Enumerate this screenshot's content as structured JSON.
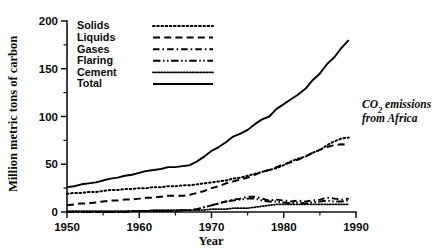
{
  "figure": {
    "annotation_line1": "CO2 emissions",
    "annotation_line1_main": "CO",
    "annotation_line1_sub": "2",
    "annotation_line1_rest": " emissions",
    "annotation_line2": "from Africa"
  },
  "axes": {
    "y_title": "Million metric tons of carbon",
    "x_title": "Year",
    "y_ticks": [
      "0",
      "50",
      "100",
      "150",
      "200"
    ],
    "x_ticks": [
      "1950",
      "1960",
      "1970",
      "1980",
      "1990"
    ]
  },
  "legend": {
    "entries": [
      {
        "label": "Solids",
        "style": "dotted"
      },
      {
        "label": "Liquids",
        "style": "dashed"
      },
      {
        "label": "Gases",
        "style": "dash-dot"
      },
      {
        "label": "Flaring",
        "style": "dash-dot-dot"
      },
      {
        "label": "Cement",
        "style": "fine-dotted"
      },
      {
        "label": "Total",
        "style": "solid"
      }
    ]
  },
  "chart_data": {
    "type": "line",
    "title": "CO2 emissions from Africa",
    "xlabel": "Year",
    "ylabel": "Million metric tons of carbon",
    "xlim": [
      1950,
      1990
    ],
    "ylim": [
      0,
      200
    ],
    "xticks": [
      1950,
      1960,
      1970,
      1980,
      1990
    ],
    "yticks": [
      0,
      50,
      100,
      150,
      200
    ],
    "grid": false,
    "legend_position": "top-left-inside",
    "x": [
      1950,
      1951,
      1952,
      1953,
      1954,
      1955,
      1956,
      1957,
      1958,
      1959,
      1960,
      1961,
      1962,
      1963,
      1964,
      1965,
      1966,
      1967,
      1968,
      1969,
      1970,
      1971,
      1972,
      1973,
      1974,
      1975,
      1976,
      1977,
      1978,
      1979,
      1980,
      1981,
      1982,
      1983,
      1984,
      1985,
      1986,
      1987,
      1988,
      1989
    ],
    "series": [
      {
        "name": "Total",
        "style": "solid",
        "values": [
          26,
          27,
          29,
          30,
          31,
          33,
          35,
          36,
          38,
          39,
          41,
          43,
          44,
          45,
          47,
          47,
          48,
          49,
          53,
          58,
          64,
          68,
          73,
          79,
          82,
          86,
          92,
          97,
          100,
          108,
          113,
          118,
          123,
          129,
          138,
          145,
          155,
          162,
          172,
          180
        ]
      },
      {
        "name": "Solids",
        "style": "dotted",
        "values": [
          19,
          20,
          20,
          21,
          21,
          22,
          23,
          23,
          24,
          24,
          25,
          25,
          26,
          26,
          27,
          27,
          28,
          28,
          29,
          30,
          31,
          32,
          33,
          35,
          36,
          38,
          40,
          42,
          44,
          46,
          49,
          53,
          56,
          58,
          62,
          65,
          70,
          74,
          77,
          78
        ]
      },
      {
        "name": "Liquids",
        "style": "dashed",
        "values": [
          7,
          8,
          9,
          9,
          10,
          11,
          12,
          12,
          13,
          13,
          14,
          15,
          15,
          16,
          17,
          17,
          17,
          18,
          20,
          22,
          25,
          27,
          30,
          32,
          34,
          36,
          39,
          42,
          44,
          47,
          50,
          52,
          55,
          58,
          62,
          65,
          68,
          70,
          71,
          70
        ]
      },
      {
        "name": "Gases",
        "style": "dash-dot",
        "values": [
          0,
          0,
          0,
          0,
          0,
          0,
          0,
          0,
          0,
          1,
          1,
          1,
          1,
          1,
          1,
          1,
          2,
          2,
          3,
          5,
          7,
          9,
          11,
          13,
          14,
          16,
          16,
          14,
          12,
          13,
          12,
          11,
          12,
          11,
          12,
          13,
          15,
          14,
          13,
          14
        ]
      },
      {
        "name": "Flaring",
        "style": "dash-dot-dot",
        "values": [
          0,
          0,
          0,
          0,
          0,
          0,
          0,
          0,
          0,
          1,
          1,
          1,
          1,
          1,
          1,
          1,
          2,
          2,
          3,
          5,
          7,
          9,
          11,
          12,
          13,
          14,
          14,
          12,
          11,
          11,
          10,
          9,
          10,
          9,
          10,
          11,
          12,
          11,
          11,
          12
        ]
      },
      {
        "name": "Cement",
        "style": "fine-dotted",
        "values": [
          1,
          1,
          1,
          1,
          1,
          1,
          1,
          1,
          1,
          1,
          1,
          1,
          2,
          2,
          2,
          2,
          2,
          2,
          2,
          2,
          3,
          3,
          3,
          4,
          4,
          4,
          5,
          6,
          7,
          8,
          8,
          8,
          8,
          8,
          8,
          8,
          8,
          8,
          8,
          8
        ]
      }
    ]
  }
}
